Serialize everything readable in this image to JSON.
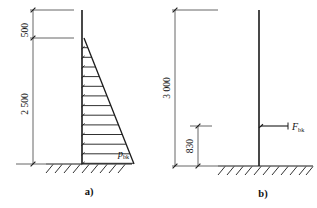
{
  "figure": {
    "background": "#ffffff",
    "line_color": "#1a1a1a",
    "panels": [
      {
        "id": "a",
        "caption": "a)",
        "column": {
          "top_y": 10,
          "bottom_y": 164,
          "x": 82
        },
        "dimensions": [
          {
            "name": "top-offset",
            "label": "500",
            "from_y": 10,
            "to_y": 38
          },
          {
            "name": "load-height",
            "label": "2 500",
            "from_y": 38,
            "to_y": 164
          }
        ],
        "load": {
          "type": "triangular-distributed",
          "label": "p",
          "label_subscript": "bk",
          "apex_y": 38,
          "base_y": 164,
          "max_width": 52,
          "arrow_count": 13,
          "direction": "left"
        },
        "ground": {
          "y": 164,
          "x_start": 46,
          "x_end": 132,
          "hatch_count": 9
        }
      },
      {
        "id": "b",
        "caption": "b)",
        "column": {
          "top_y": 10,
          "bottom_y": 166,
          "x": 259
        },
        "dimensions": [
          {
            "name": "total-height",
            "label": "3 000",
            "from_y": 10,
            "to_y": 166
          },
          {
            "name": "force-height",
            "label": "830",
            "from_y": 126,
            "to_y": 166
          }
        ],
        "load": {
          "type": "concentrated-force",
          "label": "F",
          "label_subscript": "bk",
          "arrow_y": 126,
          "arrow_from_x": 288,
          "arrow_to_x": 260,
          "direction": "left"
        },
        "ground": {
          "y": 166,
          "x_start": 218,
          "x_end": 313,
          "hatch_count": 11
        }
      }
    ]
  }
}
